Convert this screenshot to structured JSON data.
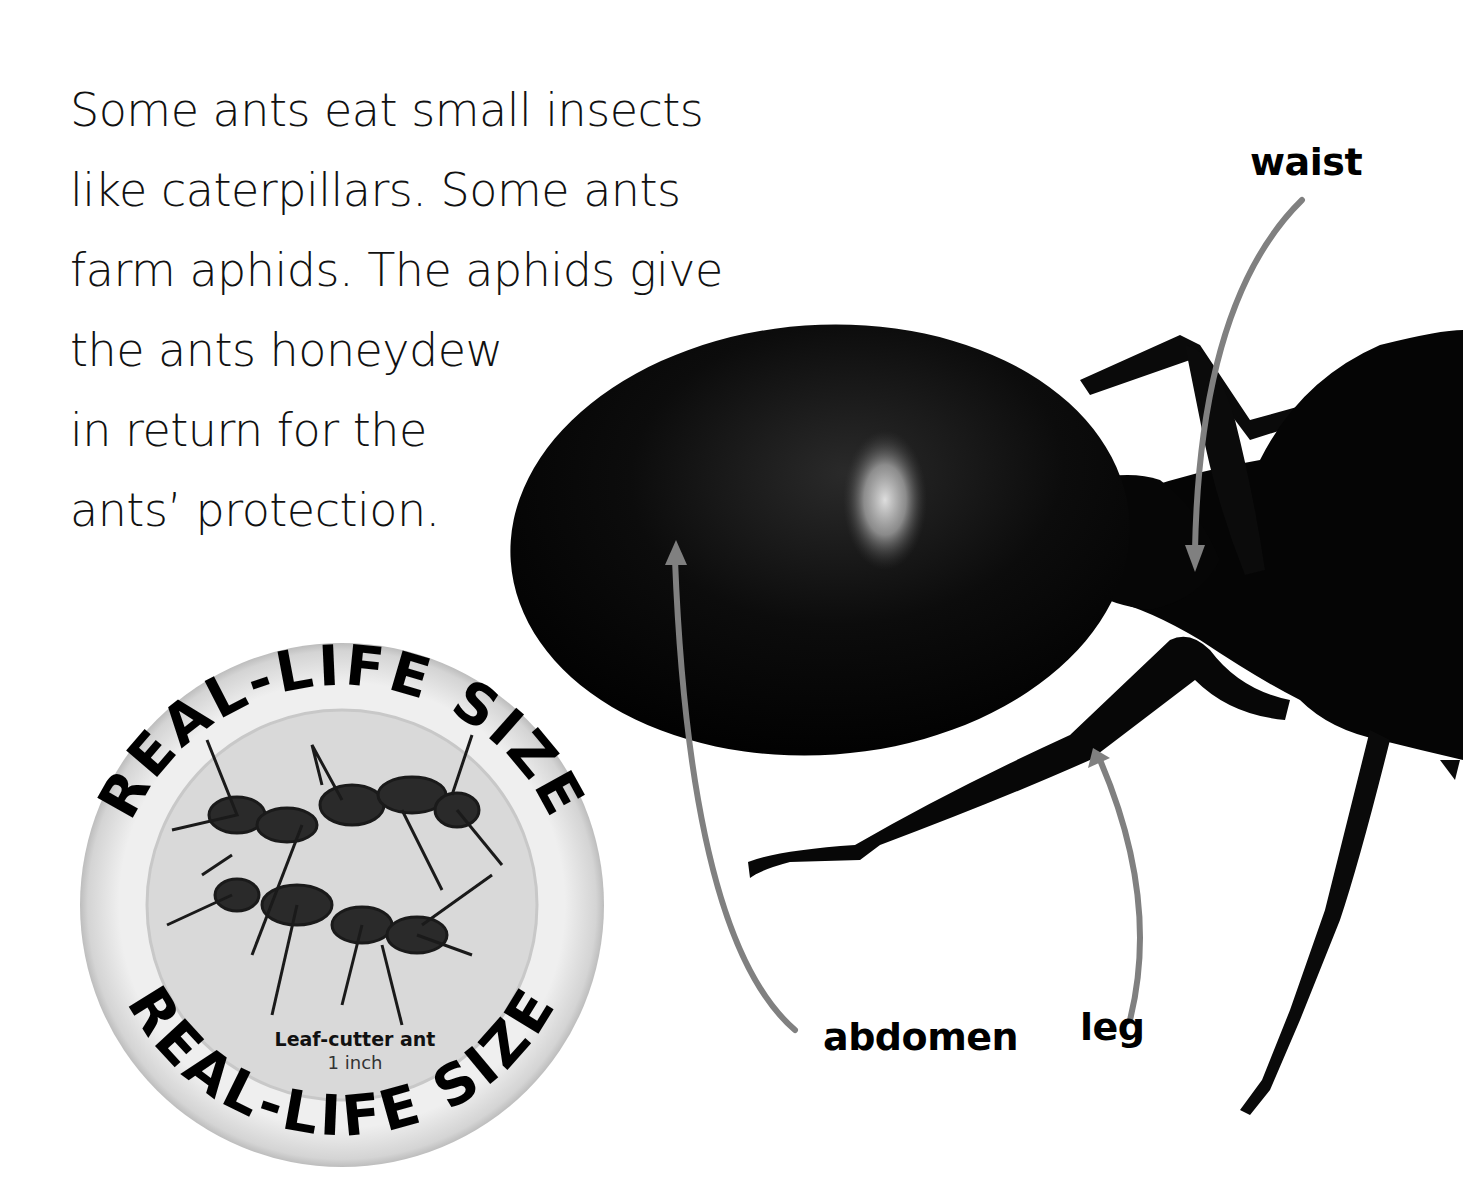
{
  "text": {
    "lines": [
      "Some ants eat small insects",
      "like caterpillars. Some ants",
      "farm aphids. The aphids give",
      "the ants honeydew",
      "in return for the",
      "ants’ protection."
    ]
  },
  "labels": {
    "waist": "waist",
    "abdomen": "abdomen",
    "leg": "leg"
  },
  "badge": {
    "ring_text_top": "REAL-LIFE SIZE",
    "ring_text_bottom": "REAL-LIFE SIZE",
    "species": "Leaf-cutter ant",
    "size": "1 inch"
  },
  "colors": {
    "arrow": "#808080",
    "ant": "#050505",
    "badge_ring": "#e8e8e8",
    "badge_inner": "#d9d9d9"
  }
}
